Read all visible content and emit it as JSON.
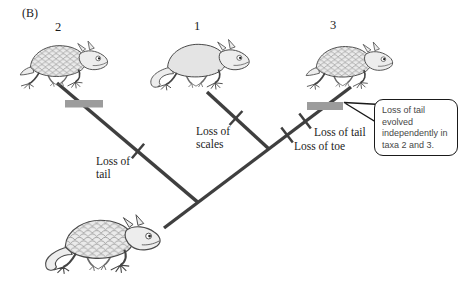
{
  "panel_label": "(B)",
  "taxa": [
    {
      "number": "2",
      "illustration": "lizard-scaled-body-tail-lost"
    },
    {
      "number": "1",
      "illustration": "lizard-smooth-body-long-tail"
    },
    {
      "number": "3",
      "illustration": "lizard-scaled-body-tail-lost"
    }
  ],
  "ancestor_illustration": "lizard-scaled-body-long-tail",
  "branch_events": [
    {
      "branch": "to-taxon-2",
      "label": "Loss of tail",
      "marker": "tick-and-gray-bar"
    },
    {
      "branch": "to-taxon-1",
      "label": "Loss of scales",
      "marker": "tick"
    },
    {
      "branch": "to-taxon-3",
      "label": "Loss of tail",
      "marker": "tick-and-gray-bar"
    },
    {
      "branch": "to-taxon-3",
      "label": "Loss of toe",
      "marker": "tick"
    }
  ],
  "callout": {
    "text": "Loss of tail evolved independently in taxa 2 and 3."
  },
  "colors": {
    "branch": "#3f3f3f",
    "highlight_bar": "#9c9c9c",
    "callout_border": "#1a1a1a",
    "text": "#1b1b1b",
    "background": "#ffffff"
  }
}
